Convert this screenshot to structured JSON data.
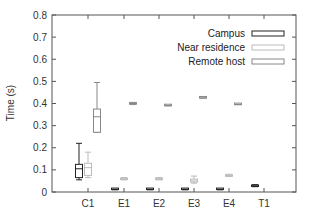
{
  "chart_data": {
    "type": "box",
    "title": "",
    "xlabel": "",
    "ylabel": "Time (s)",
    "ylim": [
      0,
      0.8
    ],
    "yticks": [
      "0",
      "0.1",
      "0.2",
      "0.3",
      "0.4",
      "0.5",
      "0.6",
      "0.7",
      "0.8"
    ],
    "categories": [
      "C1",
      "E1",
      "E2",
      "E3",
      "E4",
      "T1"
    ],
    "grid": false,
    "legend_position": "upper right",
    "series": [
      {
        "name": "Campus",
        "color": "#222222",
        "boxes": [
          {
            "category": "C1",
            "whisker_low": 0.055,
            "q1": 0.065,
            "median": 0.105,
            "q3": 0.125,
            "whisker_high": 0.22
          },
          {
            "category": "E1",
            "whisker_low": 0.01,
            "q1": 0.011,
            "median": 0.012,
            "q3": 0.014,
            "whisker_high": 0.015
          },
          {
            "category": "E2",
            "whisker_low": 0.01,
            "q1": 0.011,
            "median": 0.012,
            "q3": 0.014,
            "whisker_high": 0.015
          },
          {
            "category": "E3",
            "whisker_low": 0.01,
            "q1": 0.011,
            "median": 0.012,
            "q3": 0.014,
            "whisker_high": 0.015
          },
          {
            "category": "E4",
            "whisker_low": 0.01,
            "q1": 0.011,
            "median": 0.012,
            "q3": 0.014,
            "whisker_high": 0.015
          },
          {
            "category": "T1",
            "whisker_low": 0.024,
            "q1": 0.025,
            "median": 0.028,
            "q3": 0.031,
            "whisker_high": 0.033
          }
        ]
      },
      {
        "name": "Near residence",
        "color": "#bbbbbb",
        "boxes": [
          {
            "category": "C1",
            "whisker_low": 0.065,
            "q1": 0.075,
            "median": 0.11,
            "q3": 0.13,
            "whisker_high": 0.18
          },
          {
            "category": "E1",
            "whisker_low": 0.055,
            "q1": 0.056,
            "median": 0.06,
            "q3": 0.063,
            "whisker_high": 0.065
          },
          {
            "category": "E2",
            "whisker_low": 0.055,
            "q1": 0.056,
            "median": 0.06,
            "q3": 0.063,
            "whisker_high": 0.065
          },
          {
            "category": "E3",
            "whisker_low": 0.04,
            "q1": 0.045,
            "median": 0.05,
            "q3": 0.058,
            "whisker_high": 0.072
          },
          {
            "category": "E4",
            "whisker_low": 0.07,
            "q1": 0.071,
            "median": 0.075,
            "q3": 0.078,
            "whisker_high": 0.08
          }
        ]
      },
      {
        "name": "Remote host",
        "color": "#888888",
        "boxes": [
          {
            "category": "C1",
            "whisker_low": 0.27,
            "q1": 0.27,
            "median": 0.34,
            "q3": 0.375,
            "whisker_high": 0.495
          },
          {
            "category": "E1",
            "whisker_low": 0.395,
            "q1": 0.397,
            "median": 0.4,
            "q3": 0.403,
            "whisker_high": 0.405
          },
          {
            "category": "E2",
            "whisker_low": 0.39,
            "q1": 0.39,
            "median": 0.39,
            "q3": 0.392,
            "whisker_high": 0.393
          },
          {
            "category": "E3",
            "whisker_low": 0.425,
            "q1": 0.425,
            "median": 0.425,
            "q3": 0.427,
            "whisker_high": 0.428
          },
          {
            "category": "E4",
            "whisker_low": 0.395,
            "q1": 0.395,
            "median": 0.395,
            "q3": 0.397,
            "whisker_high": 0.398
          }
        ]
      }
    ]
  },
  "legend": {
    "items": [
      {
        "label": "Campus",
        "color": "#222222"
      },
      {
        "label": "Near residence",
        "color": "#bbbbbb"
      },
      {
        "label": "Remote host",
        "color": "#888888"
      }
    ]
  },
  "axes": {
    "y_title": "Time (s)"
  }
}
